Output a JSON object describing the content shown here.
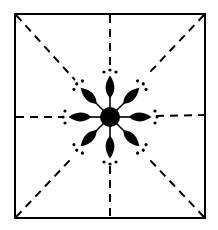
{
  "diagram": {
    "frame": {
      "x1": 15,
      "y1": 14,
      "x2": 205,
      "y2": 218
    },
    "center": {
      "x": 110,
      "y": 117
    },
    "center_radius": 10,
    "petal_count": 8,
    "stroke_color": "#000000",
    "background_color": "#ffffff"
  }
}
